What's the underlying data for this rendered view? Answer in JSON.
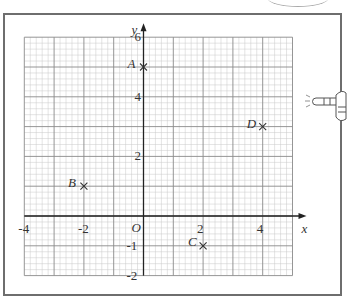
{
  "chart_data": {
    "type": "scatter",
    "title": "",
    "xlabel": "x",
    "ylabel": "y",
    "origin_label": "O",
    "xlim": [
      -4,
      5
    ],
    "ylim": [
      -2,
      6
    ],
    "grid": true,
    "grid_major_step": 1,
    "grid_minor_step": 0.2,
    "x_ticks": [
      {
        "value": -4,
        "label": "-4"
      },
      {
        "value": -2,
        "label": "-2"
      },
      {
        "value": 2,
        "label": "2"
      },
      {
        "value": 4,
        "label": "4"
      }
    ],
    "y_ticks": [
      {
        "value": 6,
        "label": "6"
      },
      {
        "value": 4,
        "label": "4"
      },
      {
        "value": 2,
        "label": "2"
      },
      {
        "value": -1,
        "label": "-1"
      },
      {
        "value": -2,
        "label": "-2"
      }
    ],
    "points": [
      {
        "label": "A",
        "x": 0,
        "y": 5
      },
      {
        "label": "B",
        "x": -2,
        "y": 1
      },
      {
        "label": "C",
        "x": 2,
        "y": -1
      },
      {
        "label": "D",
        "x": 4,
        "y": 3
      }
    ],
    "marker": "x"
  },
  "colors": {
    "frame": "#6e6e6e",
    "grid_minor": "#c8c8c8",
    "grid_major": "#8a8a8a",
    "axis": "#222222",
    "text": "#333333"
  }
}
